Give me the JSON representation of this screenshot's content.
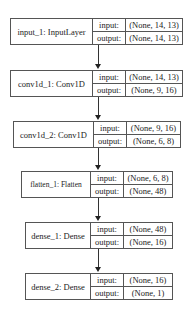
{
  "diagram": {
    "type": "keras_model_plot",
    "port_labels": {
      "input": "input:",
      "output": "output:"
    },
    "layers": [
      {
        "name": "input_1: InputLayer",
        "input": "(None, 14, 13)",
        "output": "(None, 14, 13)"
      },
      {
        "name": "conv1d_1: Conv1D",
        "input": "(None, 14, 13)",
        "output": "(None, 9, 16)"
      },
      {
        "name": "conv1d_2: Conv1D",
        "input": "(None, 9, 16)",
        "output": "(None, 6, 8)"
      },
      {
        "name": "flatten_1: Flatten",
        "input": "(None, 6, 8)",
        "output": "(None, 48)"
      },
      {
        "name": "dense_1: Dense",
        "input": "(None, 48)",
        "output": "(None, 16)"
      },
      {
        "name": "dense_2: Dense",
        "input": "(None, 16)",
        "output": "(None, 1)"
      }
    ],
    "edges": [
      {
        "from": "input_1",
        "to": "conv1d_1"
      },
      {
        "from": "conv1d_1",
        "to": "conv1d_2"
      },
      {
        "from": "conv1d_2",
        "to": "flatten_1"
      },
      {
        "from": "flatten_1",
        "to": "dense_1"
      },
      {
        "from": "dense_1",
        "to": "dense_2"
      }
    ]
  }
}
